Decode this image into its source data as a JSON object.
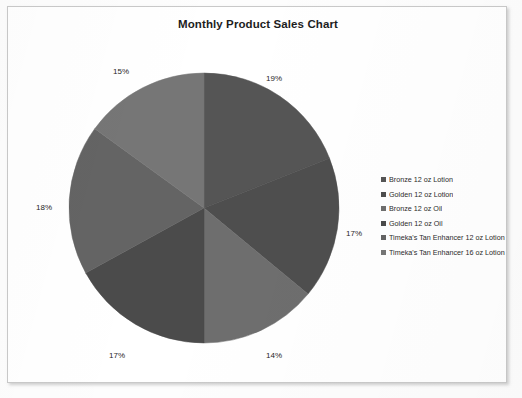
{
  "chart": {
    "title": "Monthly Product Sales Chart"
  },
  "legend": {
    "items": [
      {
        "label": "Bronze 12 oz Lotion",
        "color": "#555555"
      },
      {
        "label": "Golden 12 oz Lotion",
        "color": "#4e4e4e"
      },
      {
        "label": "Bronze 12 oz Oil",
        "color": "#6e6e6e"
      },
      {
        "label": "Golden 12 oz Oil",
        "color": "#4b4b4b"
      },
      {
        "label": "Timeka's Tan Enhancer 12 oz Lotion",
        "color": "#646464"
      },
      {
        "label": "Timeka's Tan Enhancer 16 oz Lotion",
        "color": "#767676"
      }
    ]
  },
  "labels": {
    "slice_1": "19%",
    "slice_2": "17%",
    "slice_3": "14%",
    "slice_4": "17%",
    "slice_5": "18%",
    "slice_6": "15%"
  },
  "chart_data": {
    "type": "pie",
    "title": "Monthly Product Sales Chart",
    "categories": [
      "Bronze 12 oz Lotion",
      "Golden 12 oz Lotion",
      "Bronze 12 oz Oil",
      "Golden 12 oz Oil",
      "Timeka's Tan Enhancer 12 oz Lotion",
      "Timeka's Tan Enhancer 16 oz Lotion"
    ],
    "values": [
      19,
      17,
      14,
      17,
      18,
      15
    ],
    "data_labels": [
      "19%",
      "17%",
      "14%",
      "17%",
      "18%",
      "15%"
    ],
    "colors": [
      "#555555",
      "#4e4e4e",
      "#6e6e6e",
      "#4b4b4b",
      "#646464",
      "#767676"
    ],
    "units": "percent",
    "start_angle_deg": 0,
    "direction": "clockwise",
    "legend": true,
    "legend_position": "right",
    "grid": false,
    "xlabel": "",
    "ylabel": ""
  }
}
